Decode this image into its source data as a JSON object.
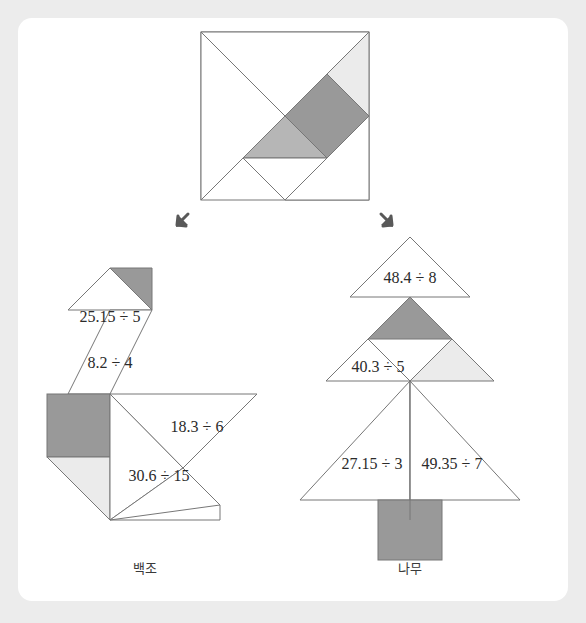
{
  "page": {
    "background_color": "#ececec",
    "card_color": "#ffffff"
  },
  "palette": {
    "stroke": "#777777",
    "dark_gray": "#999999",
    "medium_gray": "#b6b6b6",
    "light_gray": "#ebebeb",
    "white": "#ffffff",
    "text": "#2b2b2b",
    "arrow": "#595959"
  },
  "source_tangram": {
    "name": "tangram-square",
    "description": "square tangram with seven pieces"
  },
  "arrows": [
    {
      "name": "arrow-to-swan",
      "direction": "down-left"
    },
    {
      "name": "arrow-to-tree",
      "direction": "down-right"
    }
  ],
  "figures": [
    {
      "id": "swan",
      "caption": "백조",
      "equations": [
        {
          "id": "swan-eq-1",
          "text": "25.15 ÷ 5"
        },
        {
          "id": "swan-eq-2",
          "text": "8.2 ÷ 4"
        },
        {
          "id": "swan-eq-3",
          "text": "18.3 ÷ 6"
        },
        {
          "id": "swan-eq-4",
          "text": "30.6 ÷ 15"
        }
      ]
    },
    {
      "id": "tree",
      "caption": "나무",
      "equations": [
        {
          "id": "tree-eq-1",
          "text": "48.4 ÷ 8"
        },
        {
          "id": "tree-eq-2",
          "text": "40.3 ÷ 5"
        },
        {
          "id": "tree-eq-3",
          "text": "27.15 ÷ 3"
        },
        {
          "id": "tree-eq-4",
          "text": "49.35 ÷ 7"
        }
      ]
    }
  ]
}
